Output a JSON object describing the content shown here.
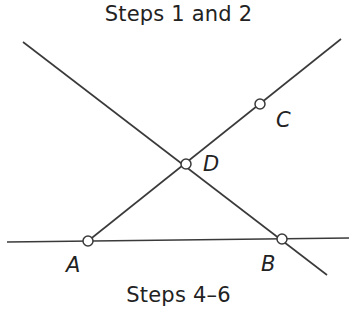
{
  "captions": {
    "top": "Steps 1 and 2",
    "bottom": "Steps 4–6"
  },
  "points": [
    {
      "id": "A",
      "label": "A",
      "x": 88,
      "y": 241,
      "label_x": 66,
      "label_y": 272
    },
    {
      "id": "B",
      "label": "B",
      "x": 282,
      "y": 239,
      "label_x": 261,
      "label_y": 271
    },
    {
      "id": "C",
      "label": "C",
      "x": 260,
      "y": 104,
      "label_x": 276,
      "label_y": 127
    },
    {
      "id": "D",
      "label": "D",
      "x": 186,
      "y": 164,
      "label_x": 203,
      "label_y": 171
    }
  ],
  "lines": [
    {
      "name": "line-ab",
      "x1": 7,
      "y1": 242,
      "x2": 349,
      "y2": 238
    },
    {
      "name": "line-adc",
      "x1": 88,
      "y1": 241,
      "x2": 341,
      "y2": 39
    },
    {
      "name": "line-db",
      "x1": 23,
      "y1": 42,
      "x2": 327,
      "y2": 275
    }
  ],
  "colors": {
    "stroke": "#3a3a3a",
    "text": "#222222",
    "background": "#ffffff"
  }
}
